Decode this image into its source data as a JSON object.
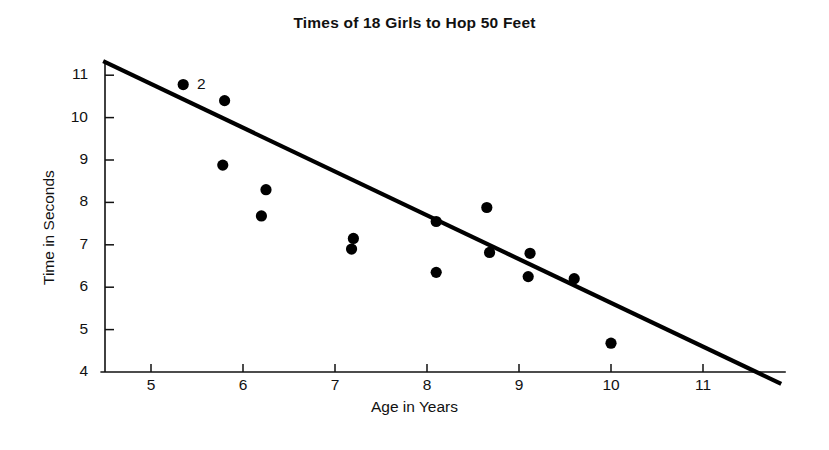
{
  "chart_data": {
    "type": "scatter",
    "title": "Times of 18 Girls to Hop 50 Feet",
    "xlabel": "Age in Years",
    "ylabel": "Time in Seconds",
    "xlim": [
      4.45,
      11.9
    ],
    "ylim": [
      4,
      11.35
    ],
    "xticks": [
      5,
      6,
      7,
      8,
      9,
      10,
      11
    ],
    "xtick_labels": [
      "5",
      "6",
      "7",
      "8",
      "9",
      "10",
      "11"
    ],
    "yticks": [
      4,
      5,
      6,
      7,
      8,
      9,
      10,
      11
    ],
    "ytick_labels": [
      "4",
      "5",
      "6",
      "7",
      "8",
      "9",
      "10",
      "11"
    ],
    "grid": false,
    "legend": "none",
    "series": [
      {
        "name": "Girls",
        "marker": "filled-circle",
        "color": "#000000",
        "points": [
          {
            "x": 5.35,
            "y": 10.78,
            "label": "2"
          },
          {
            "x": 5.8,
            "y": 10.4
          },
          {
            "x": 5.78,
            "y": 8.88
          },
          {
            "x": 6.25,
            "y": 8.3
          },
          {
            "x": 6.2,
            "y": 7.68
          },
          {
            "x": 7.2,
            "y": 7.15
          },
          {
            "x": 7.18,
            "y": 6.9
          },
          {
            "x": 8.1,
            "y": 7.55
          },
          {
            "x": 8.1,
            "y": 6.35
          },
          {
            "x": 8.65,
            "y": 7.88
          },
          {
            "x": 8.68,
            "y": 6.82
          },
          {
            "x": 9.12,
            "y": 6.8
          },
          {
            "x": 9.1,
            "y": 6.25
          },
          {
            "x": 9.6,
            "y": 6.2
          },
          {
            "x": 10.0,
            "y": 4.68
          }
        ]
      }
    ],
    "trend_line": {
      "name": "fitted-line",
      "color": "#000000",
      "x_start": 4.48,
      "y_start": 11.33,
      "x_end": 11.85,
      "y_end": 3.72
    },
    "annotations": [
      {
        "text": "2",
        "x": 5.5,
        "y": 10.95,
        "note": "count label for overlapping points"
      }
    ]
  }
}
